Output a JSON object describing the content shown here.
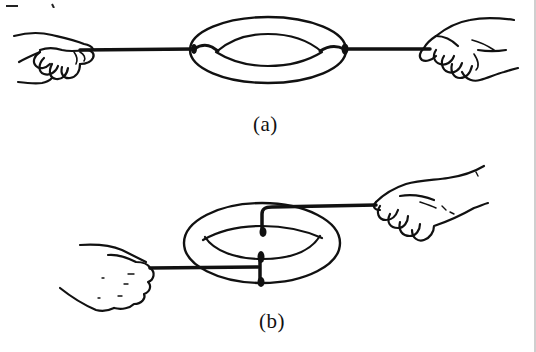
{
  "figure": {
    "panels": [
      {
        "id": "a",
        "caption": "(a)",
        "description": "Two hands pulling a rope whose ends are tied around opposite sides of a ring (torus); the rope lies in the plane of the ring"
      },
      {
        "id": "b",
        "caption": "(b)",
        "description": "Two hands pulling a rope that is wrapped vertically through a ring (torus) at two points; the ring is viewed in perspective"
      }
    ],
    "colors": {
      "ink": "#111111",
      "background": "#ffffff"
    }
  }
}
